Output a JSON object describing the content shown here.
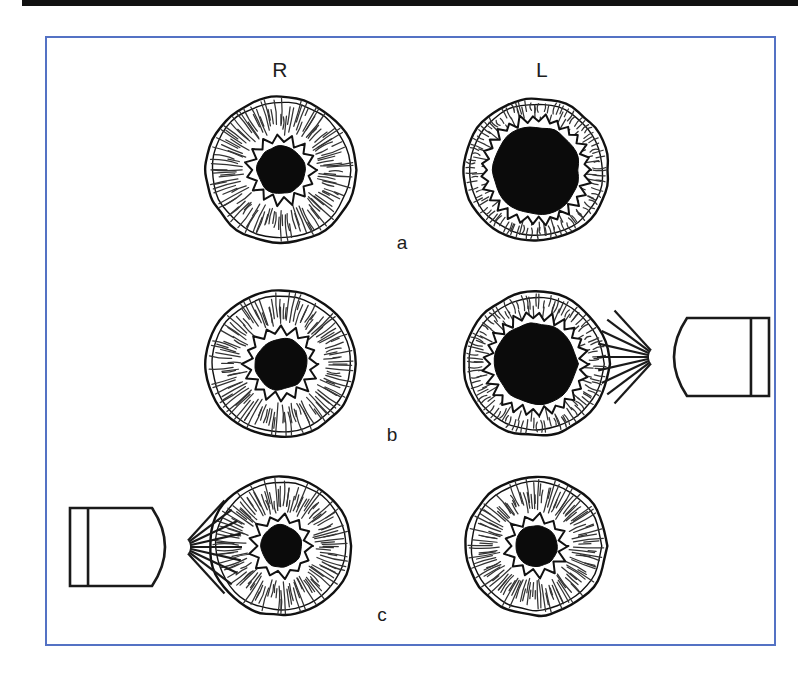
{
  "figure": {
    "top_rule_color": "#111111",
    "frame_border_color": "#5472c4",
    "background_color": "#ffffff",
    "pupil_color": "#0b0b0b",
    "ink_color": "#111111"
  },
  "headers": {
    "right_eye": "R",
    "left_eye": "L"
  },
  "rows": [
    {
      "label": "a",
      "light_source": "none",
      "eyes": [
        {
          "side": "R",
          "iris_radius": 75,
          "pupil_radius": 24,
          "state": "normal"
        },
        {
          "side": "L",
          "iris_radius": 73,
          "pupil_radius": 44,
          "state": "dilated"
        }
      ]
    },
    {
      "label": "b",
      "light_source": "right-of-left-eye",
      "light_direction": "pointing-left",
      "eyes": [
        {
          "side": "R",
          "iris_radius": 75,
          "pupil_radius": 26,
          "state": "normal"
        },
        {
          "side": "L",
          "iris_radius": 73,
          "pupil_radius": 41,
          "state": "dilated"
        }
      ]
    },
    {
      "label": "c",
      "light_source": "left-of-right-eye",
      "light_direction": "pointing-right",
      "eyes": [
        {
          "side": "R",
          "iris_radius": 71,
          "pupil_radius": 21,
          "state": "constricted"
        },
        {
          "side": "L",
          "iris_radius": 71,
          "pupil_radius": 21,
          "state": "constricted"
        }
      ]
    }
  ],
  "icons": {
    "penlight": "penlight-icon",
    "light-rays": "light-rays-icon"
  }
}
